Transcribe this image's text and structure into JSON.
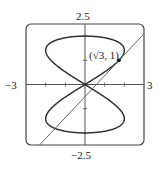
{
  "chart_data": {
    "type": "line",
    "title": "",
    "xlabel": "",
    "ylabel": "",
    "xlim": [
      -3,
      3
    ],
    "ylim": [
      -2.5,
      2.5
    ],
    "grid": false,
    "legend": null,
    "tick_labels": {
      "x_min": "−3",
      "x_max": "3",
      "y_min": "−2.5",
      "y_max": "2.5"
    },
    "x_ticks": [
      -2,
      -1,
      1,
      2
    ],
    "y_ticks": [
      -2,
      -1,
      1,
      2
    ],
    "series": [
      {
        "name": "curve",
        "kind": "parametric",
        "equations": {
          "x": "2 sin(2t)",
          "y": "2 sin(t)"
        },
        "t_range": [
          0,
          6.2832
        ],
        "color": "#333333"
      },
      {
        "name": "tangent line",
        "kind": "line",
        "equation": "y = (√3/2)x − 1/2",
        "slope": 0.866,
        "intercept": -0.5,
        "color": "#555555"
      }
    ],
    "annotations": [
      {
        "text": "(√3, 1)",
        "x": 1.732,
        "y": 1,
        "marker": "dot"
      }
    ]
  },
  "labels": {
    "y_max": "2.5",
    "y_min": "−2.5",
    "x_min": "−3",
    "x_max": "3",
    "point": "(√3, 1)"
  },
  "colors": {
    "axes": "#555555",
    "frame": "#444444",
    "curve": "#333333",
    "line": "#666666"
  }
}
